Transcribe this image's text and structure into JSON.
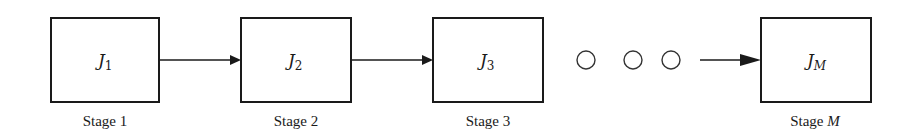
{
  "diagram": {
    "type": "sequential-stage-flow",
    "stages": [
      {
        "job_main": "J",
        "job_sub": "1",
        "sub_italic": false,
        "label_text": "Stage ",
        "label_var": "1",
        "label_var_italic": false
      },
      {
        "job_main": "J",
        "job_sub": "2",
        "sub_italic": false,
        "label_text": "Stage ",
        "label_var": "2",
        "label_var_italic": false
      },
      {
        "job_main": "J",
        "job_sub": "3",
        "sub_italic": false,
        "label_text": "Stage ",
        "label_var": "3",
        "label_var_italic": false
      },
      {
        "job_main": "J",
        "job_sub": "M",
        "sub_italic": true,
        "label_text": "Stage ",
        "label_var": "M",
        "label_var_italic": true
      }
    ],
    "ellipsis": {
      "count": 3,
      "symbol": "○"
    },
    "connections": [
      {
        "from": "Stage 1",
        "to": "Stage 2"
      },
      {
        "from": "Stage 2",
        "to": "Stage 3"
      },
      {
        "from": "ellipsis",
        "to": "Stage M"
      }
    ],
    "colors": {
      "stroke": "#1a1a1a",
      "background": "#ffffff"
    }
  }
}
